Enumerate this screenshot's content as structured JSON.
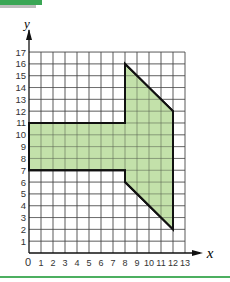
{
  "chart_data": {
    "type": "polygon-on-grid",
    "xlabel": "x",
    "ylabel": "y",
    "xlim": [
      0,
      13
    ],
    "ylim": [
      0,
      17
    ],
    "x_ticks": [
      0,
      1,
      2,
      3,
      4,
      5,
      6,
      7,
      8,
      9,
      10,
      11,
      12,
      13
    ],
    "y_ticks": [
      1,
      2,
      3,
      4,
      5,
      6,
      7,
      8,
      9,
      10,
      11,
      12,
      13,
      14,
      15,
      16,
      17
    ],
    "grid": true,
    "shape": {
      "vertices": [
        [
          0,
          7
        ],
        [
          0,
          11
        ],
        [
          8,
          11
        ],
        [
          8,
          16
        ],
        [
          12,
          12
        ],
        [
          12,
          2
        ],
        [
          8,
          6
        ],
        [
          8,
          7
        ]
      ],
      "fill": "#b9dc9b",
      "stroke": "#111111"
    }
  },
  "labels": {
    "x_axis": "x",
    "y_axis": "y",
    "origin": "0"
  },
  "colors": {
    "accent_green": "#3aa655",
    "shape_fill": "#b9dc9b",
    "grid": "#333333"
  }
}
